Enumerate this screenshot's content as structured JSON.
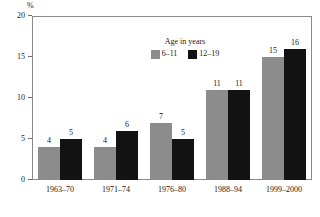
{
  "chart_data": {
    "type": "bar",
    "title": "",
    "subtitle": "",
    "xlabel": "",
    "ylabel": "%",
    "unit_label": "%",
    "ylim": [
      0,
      20
    ],
    "yticks": [
      0,
      5,
      10,
      15,
      20
    ],
    "ytick_labels": [
      "0",
      "5",
      "10",
      "15",
      "20"
    ],
    "grid": false,
    "legend_position": "inside-top-center",
    "legend_title": "Age in years",
    "categories": [
      "1963–70",
      "1971–74",
      "1976–80",
      "1988–94",
      "1999–2000"
    ],
    "series": [
      {
        "name": "6–11",
        "color": "#8c8c8c",
        "values": [
          4,
          4,
          7,
          11,
          15
        ],
        "data_labels": [
          "4",
          "4",
          "7",
          "11",
          "15"
        ]
      },
      {
        "name": "12–19",
        "color": "#121212",
        "values": [
          5,
          6,
          5,
          11,
          16
        ],
        "data_labels": [
          "5",
          "6",
          "5",
          "11",
          "16"
        ]
      }
    ]
  },
  "legend": {
    "title": "Age in years",
    "items": [
      {
        "label": "6–11",
        "color": "#8c8c8c"
      },
      {
        "label": "12–19",
        "color": "#121212"
      }
    ]
  },
  "axes": {
    "y_unit": "%",
    "y_tick_labels": [
      "20",
      "15",
      "10",
      "5",
      "0"
    ],
    "x_tick_labels": [
      "1963–70",
      "1971–74",
      "1976–80",
      "1988–94",
      "1999–2000"
    ]
  },
  "colors": {
    "series_6_11": "#8c8c8c",
    "series_12_19": "#121212",
    "frame": "#8a8a8a",
    "text": "#1a1a1a",
    "background": "#ffffff"
  }
}
